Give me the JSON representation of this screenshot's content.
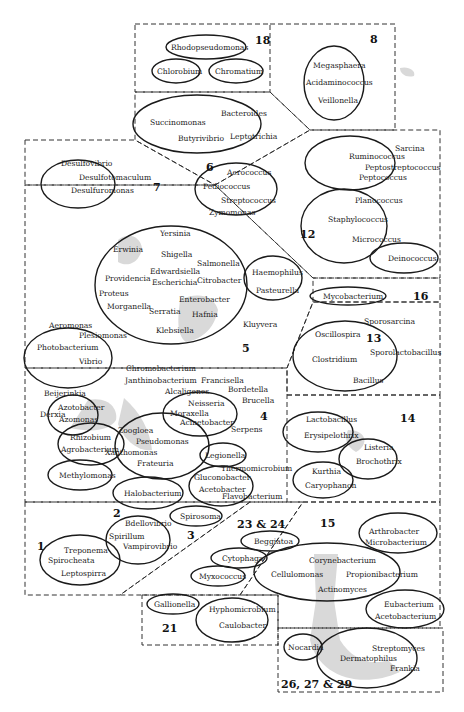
{
  "figure": {
    "type": "taxonomic-grouping-diagram",
    "colors": {
      "line": "#1a1a1a",
      "shade": "#d9d9d9",
      "background": "#ffffff"
    }
  },
  "groups": [
    {
      "id": "18",
      "label": "18",
      "taxa": [
        "Rhodopseudomonas",
        "Chlorobium",
        "Chromatium"
      ]
    },
    {
      "id": "8",
      "label": "8",
      "taxa": [
        "Megasphaera",
        "Acidaminococcus",
        "Veillonella"
      ]
    },
    {
      "id": "6",
      "label": "6",
      "taxa": [
        "Succinomonas",
        "Bacteroides",
        "Butyrivibrio",
        "Leptotrichia"
      ]
    },
    {
      "id": "7",
      "label": "7",
      "taxa": [
        "Desulfovibrio",
        "Desulfotomaculum",
        "Desulfuromonas"
      ]
    },
    {
      "id": "12",
      "label": "12",
      "taxa": [
        "Sarcina",
        "Ruminococcus",
        "Peptostreptococcus",
        "Peptococcus",
        "Aerococcus",
        "Pediococcus",
        "Streptococcus",
        "Planococcus",
        "Staphylococcus",
        "Micrococcus",
        "Deinococcus"
      ]
    },
    {
      "id": "5",
      "label": "5",
      "taxa": [
        "Zymomonas",
        "Yersinia",
        "Erwinia",
        "Shigella",
        "Salmonella",
        "Providencia",
        "Edwardsiella",
        "Escherichia",
        "Citrobacter",
        "Proteus",
        "Enterobacter",
        "Morganella",
        "Serratia",
        "Hafnia",
        "Klebsiella",
        "Haemophilus",
        "Pasteurella",
        "Kluyvera",
        "Aeromonas",
        "Plesiomonas",
        "Photobacterium",
        "Vibrio",
        "Chromobacterium"
      ]
    },
    {
      "id": "16",
      "label": "16",
      "taxa": [
        "Mycobacterium"
      ]
    },
    {
      "id": "13",
      "label": "13",
      "taxa": [
        "Sporosarcina",
        "Oscillospira",
        "Clostridium",
        "Sporolactobacillus",
        "Bacillus"
      ]
    },
    {
      "id": "4",
      "label": "4",
      "taxa": [
        "Janthinobacterium",
        "Francisella",
        "Bordetella",
        "Brucella",
        "Beijerinkia",
        "Alcaligenes",
        "Derxia",
        "Azotobacter",
        "Azomonas",
        "Neisseria",
        "Moraxella",
        "Acinetobacter",
        "Serpens",
        "Zoogloea",
        "Pseudomonas",
        "Xanthomonas",
        "Frateuria",
        "Rhizobium",
        "Agrobacterium",
        "Legionella",
        "Methylomonas",
        "Gluconobacter",
        "Acetobacter",
        "Thermomicrobium",
        "Halobacterium",
        "Flavobacterium"
      ]
    },
    {
      "id": "14",
      "label": "14",
      "taxa": [
        "Lactobacillus",
        "Erysipelothrix",
        "Listeria",
        "Brochothrix",
        "Kurthia",
        "Caryophanon"
      ]
    },
    {
      "id": "1",
      "label": "1",
      "taxa": [
        "Treponema",
        "Spirocheata",
        "Leptospirra"
      ]
    },
    {
      "id": "2",
      "label": "2",
      "taxa": [
        "Bdellovibrio",
        "Spirillum",
        "Vampirovibrio"
      ]
    },
    {
      "id": "3",
      "label": "3",
      "taxa": [
        "Spirosoma"
      ]
    },
    {
      "id": "23&24",
      "label": "23 & 24",
      "taxa": [
        "Beggiatoa",
        "Cytophaga",
        "Myxococcus"
      ]
    },
    {
      "id": "15",
      "label": "15",
      "taxa": [
        "Arthrobacter",
        "Microbacterium",
        "Corynebacterium",
        "Cellulomonas",
        "Propionibacterium",
        "Actinomyces",
        "Eubacterium",
        "Acetobacterium"
      ]
    },
    {
      "id": "21",
      "label": "21",
      "taxa": [
        "Gallionella",
        "Hyphomicrobium",
        "Caulobacter"
      ]
    },
    {
      "id": "26-29",
      "label": "26, 27 & 29",
      "taxa": [
        "Nocardia",
        "Streptomyces",
        "Dermatophilus",
        "Frankia"
      ]
    }
  ],
  "labels": {
    "g18": "18",
    "g8": "8",
    "g6": "6",
    "g7": "7",
    "g12": "12",
    "g5": "5",
    "g16": "16",
    "g13": "13",
    "g4": "4",
    "g14": "14",
    "g1": "1",
    "g2": "2",
    "g3": "3",
    "g2324": "23 & 24",
    "g15": "15",
    "g21": "21",
    "g262729": "26, 27 & 29"
  },
  "t": {
    "rhodopseudomonas": "Rhodopseudomonas",
    "chlorobium": "Chlorobium",
    "chromatium": "Chromatium",
    "megasphaera": "Megasphaera",
    "acidaminococcus": "Acidaminococcus",
    "veillonella": "Veillonella",
    "succinomonas": "Succinomonas",
    "bacteroides": "Bacteroides",
    "butyrivibrio": "Butyrivibrio",
    "leptotrichia": "Leptotrichia",
    "desulfovibrio": "Desulfovibrio",
    "desulfotomaculum": "Desulfotomaculum",
    "desulfuromonas": "Desulfuromonas",
    "sarcina": "Sarcina",
    "ruminococcus": "Ruminococcus",
    "peptostreptococcus": "Peptostreptococcus",
    "peptococcus": "Peptococcus",
    "aerococcus": "Aerococcus",
    "pediococcus": "Pediococcus",
    "streptococcus": "Streptococcus",
    "planococcus": "Planococcus",
    "staphylococcus": "Staphylococcus",
    "micrococcus": "Micrococcus",
    "deinococcus": "Deinococcus",
    "zymomonas": "Zymomonas",
    "yersinia": "Yersinia",
    "erwinia": "Erwinia",
    "shigella": "Shigella",
    "salmonella": "Salmonella",
    "providencia": "Providencia",
    "edwardsiella": "Edwardsiella",
    "escherichia": "Escherichia",
    "citrobacter": "Citrobacter",
    "proteus": "Proteus",
    "enterobacter": "Enterobacter",
    "morganella": "Morganella",
    "serratia": "Serratia",
    "hafnia": "Hafnia",
    "klebsiella": "Klebsiella",
    "haemophilus": "Haemophilus",
    "pasteurella": "Pasteurella",
    "kluyvera": "Kluyvera",
    "aeromonas": "Aeromonas",
    "plesiomonas": "Plesiomonas",
    "photobacterium": "Photobacterium",
    "vibrio": "Vibrio",
    "chromobacterium": "Chromobacterium",
    "mycobacterium": "Mycobacterium",
    "sporosarcina": "Sporosarcina",
    "oscillospira": "Oscillospira",
    "clostridium": "Clostridium",
    "sporolactobacillus": "Sporolactobacillus",
    "bacillus": "Bacillus",
    "janthinobacterium": "Janthinobacterium",
    "francisella": "Francisella",
    "bordetella": "Bordetella",
    "brucella": "Brucella",
    "beijerinkia": "Beijerinkia",
    "alcaligenes": "Alcaligenes",
    "derxia": "Derxia",
    "azotobacter": "Azotobacter",
    "azomonas": "Azomonas",
    "neisseria": "Neisseria",
    "moraxella": "Moraxella",
    "acinetobacter": "Acinetobacter",
    "serpens": "Serpens",
    "zoogloea": "Zoogloea",
    "pseudomonas": "Pseudomonas",
    "xanthomonas": "Xanthomonas",
    "frateuria": "Frateuria",
    "rhizobium": "Rhizobium",
    "agrobacterium": "Agrobacterium",
    "legionella": "Legionella",
    "methylomonas": "Methylomonas",
    "gluconobacter": "Gluconobacter",
    "acetobacter": "Acetobacter",
    "thermomicrobium": "Thermomicrobium",
    "halobacterium": "Halobacterium",
    "flavobacterium": "Flavobacterium",
    "lactobacillus": "Lactobacillus",
    "erysipelothrix": "Erysipelothrix",
    "listeria": "Listeria",
    "brochothrix": "Brochothrix",
    "kurthia": "Kurthia",
    "caryophanon": "Caryophanon",
    "treponema": "Treponema",
    "spirocheata": "Spirocheata",
    "leptospirra": "Leptospirra",
    "bdellovibrio": "Bdellovibrio",
    "spirillum": "Spirillum",
    "vampirovibrio": "Vampirovibrio",
    "spirosoma": "Spirosoma",
    "beggiatoa": "Beggiatoa",
    "cytophaga": "Cytophaga",
    "myxococcus": "Myxococcus",
    "arthrobacter": "Arthrobacter",
    "microbacterium": "Microbacterium",
    "corynebacterium": "Corynebacterium",
    "cellulomonas": "Cellulomonas",
    "propionibacterium": "Propionibacterium",
    "actinomyces": "Actinomyces",
    "eubacterium": "Eubacterium",
    "acetobacterium": "Acetobacterium",
    "gallionella": "Gallionella",
    "hyphomicrobium": "Hyphomicrobium",
    "caulobacter": "Caulobacter",
    "nocardia": "Nocardia",
    "streptomyces": "Streptomyces",
    "dermatophilus": "Dermatophilus",
    "frankia": "Frankia"
  }
}
